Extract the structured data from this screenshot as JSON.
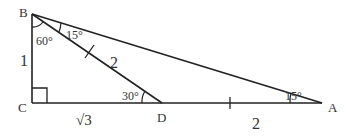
{
  "diagram": {
    "type": "geometry-triangle",
    "points": {
      "B": {
        "label": "B"
      },
      "C": {
        "label": "C"
      },
      "D": {
        "label": "D"
      },
      "A": {
        "label": "A"
      }
    },
    "angles": {
      "B_total": "60°",
      "ABD": "15°",
      "BDC": "30°",
      "BAD": "15°"
    },
    "lengths": {
      "BC": "1",
      "CD": "√3",
      "BD": "2",
      "DA": "2"
    },
    "colors": {
      "line": "#222222",
      "text": "#333333"
    }
  }
}
